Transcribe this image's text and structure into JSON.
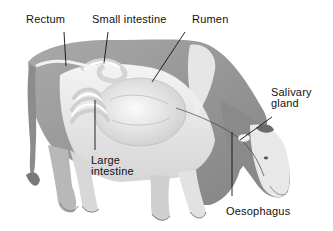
{
  "figure": {
    "background_color": "#ffffff",
    "ink_color": "#111111"
  },
  "labels": {
    "rectum": {
      "text": "Rectum"
    },
    "small_intestine": {
      "text": "Small intestine"
    },
    "rumen": {
      "text": "Rumen"
    },
    "salivary_gland": {
      "line1": "Salivary",
      "line2": "gland"
    },
    "large_intestine": {
      "line1": "Large",
      "line2": "intestine"
    },
    "oesophagus": {
      "text": "Oesophagus"
    }
  }
}
